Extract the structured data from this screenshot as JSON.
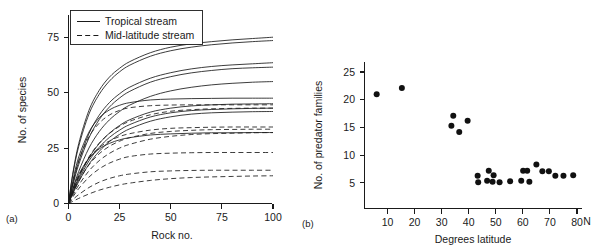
{
  "figure": {
    "background": "#ffffff",
    "ink_color": "#1a1a1a"
  },
  "panel_a": {
    "label": "(a)",
    "legend": {
      "tropical_label": "Tropical stream",
      "midlatitude_label": "Mid-latitude stream"
    }
  },
  "panel_b": {
    "label": "(b)",
    "x_suffix": "N"
  },
  "chart_data": [
    {
      "panel": "(a)",
      "type": "line",
      "title": "",
      "xlabel": "Rock no.",
      "ylabel": "No. of species",
      "xlim": [
        0,
        100
      ],
      "ylim": [
        0,
        85
      ],
      "xticks": [
        0,
        25,
        50,
        75,
        100
      ],
      "yticks": [
        0,
        25,
        50,
        75
      ],
      "xtick_labels": [
        "0",
        "25",
        "50",
        "75",
        "100"
      ],
      "ytick_labels": [
        "0",
        "25",
        "50",
        "75"
      ],
      "grid": false,
      "legend_position": "top-left",
      "legend_entries": [
        {
          "name": "Tropical stream",
          "style": "solid"
        },
        {
          "name": "Mid-latitude stream",
          "style": "dashed"
        }
      ],
      "note": "Species accumulation curves; each curve is a rarefaction-style saturating curve of form S = A*(1-exp(-k*x)) sampled at x = 0,2,5,10,15,20,25,30,40,50,60,70,80,90,100",
      "x": [
        0,
        2,
        5,
        10,
        15,
        20,
        25,
        30,
        40,
        50,
        60,
        70,
        80,
        90,
        100
      ],
      "series": [
        {
          "name": "tropical-1",
          "style": "solid",
          "asymptote": 75,
          "values": [
            0,
            13.0,
            27.0,
            42.0,
            51.0,
            57.0,
            61.0,
            64.0,
            68.0,
            70.5,
            72.0,
            73.0,
            73.8,
            74.4,
            75.0
          ]
        },
        {
          "name": "tropical-2",
          "style": "solid",
          "asymptote": 73.5,
          "values": [
            0,
            12.4,
            25.8,
            40.3,
            49.2,
            55.2,
            59.4,
            62.4,
            66.4,
            68.9,
            70.5,
            71.6,
            72.4,
            73.0,
            73.5
          ]
        },
        {
          "name": "tropical-3",
          "style": "solid",
          "asymptote": 63.5,
          "values": [
            0,
            8.5,
            19.0,
            31.5,
            39.8,
            45.5,
            49.5,
            52.5,
            56.5,
            59.0,
            60.7,
            61.8,
            62.5,
            63.0,
            63.5
          ]
        },
        {
          "name": "tropical-4",
          "style": "solid",
          "asymptote": 61.5,
          "values": [
            0,
            7.8,
            17.6,
            29.6,
            37.8,
            43.5,
            47.6,
            50.6,
            54.7,
            57.2,
            58.9,
            60.0,
            60.8,
            61.2,
            61.5
          ]
        },
        {
          "name": "tropical-5",
          "style": "solid",
          "asymptote": 55.0,
          "values": [
            0,
            6.3,
            14.5,
            25.0,
            32.4,
            37.7,
            41.5,
            44.4,
            48.3,
            50.8,
            52.4,
            53.5,
            54.2,
            54.7,
            55.0
          ]
        },
        {
          "name": "tropical-6",
          "style": "solid",
          "asymptote": 47.5,
          "values": [
            0,
            9.8,
            21.0,
            32.2,
            38.6,
            42.2,
            44.3,
            45.5,
            46.7,
            47.1,
            47.3,
            47.4,
            47.5,
            47.5,
            47.5
          ]
        },
        {
          "name": "tropical-7",
          "style": "solid",
          "asymptote": 45.0,
          "values": [
            0,
            5.0,
            11.7,
            20.6,
            27.0,
            31.7,
            35.2,
            37.8,
            41.2,
            43.0,
            44.0,
            44.5,
            44.8,
            44.9,
            45.0
          ]
        },
        {
          "name": "tropical-8",
          "style": "solid",
          "asymptote": 43.0,
          "values": [
            0,
            4.6,
            10.8,
            19.2,
            25.3,
            29.8,
            33.1,
            35.6,
            39.0,
            40.9,
            41.9,
            42.4,
            42.7,
            42.9,
            43.0
          ]
        },
        {
          "name": "tropical-9",
          "style": "solid",
          "asymptote": 41.5,
          "values": [
            0,
            4.2,
            9.9,
            17.7,
            23.5,
            27.9,
            31.2,
            33.7,
            37.1,
            39.1,
            40.3,
            40.9,
            41.2,
            41.4,
            41.5
          ]
        },
        {
          "name": "tropical-10",
          "style": "solid",
          "asymptote": 32.0,
          "values": [
            0,
            6.0,
            13.1,
            20.4,
            24.6,
            27.1,
            28.7,
            29.7,
            30.9,
            31.4,
            31.7,
            31.9,
            31.9,
            32.0,
            32.0
          ]
        },
        {
          "name": "midlat-1",
          "style": "dashed",
          "asymptote": 44.5,
          "values": [
            0,
            8.8,
            19.3,
            30.0,
            36.2,
            39.9,
            42.0,
            43.2,
            44.1,
            44.4,
            44.5,
            44.5,
            44.5,
            44.5,
            44.5
          ]
        },
        {
          "name": "midlat-2",
          "style": "dashed",
          "asymptote": 43.0,
          "values": [
            0,
            5.2,
            12.1,
            21.0,
            27.2,
            31.6,
            34.8,
            37.1,
            40.0,
            41.6,
            42.3,
            42.7,
            42.9,
            43.0,
            43.0
          ]
        },
        {
          "name": "midlat-3",
          "style": "dashed",
          "asymptote": 34.5,
          "values": [
            0,
            5.6,
            12.4,
            20.4,
            25.2,
            28.2,
            30.2,
            31.5,
            33.1,
            33.9,
            34.2,
            34.4,
            34.5,
            34.5,
            34.5
          ]
        },
        {
          "name": "midlat-4",
          "style": "dashed",
          "asymptote": 33.5,
          "values": [
            0,
            4.4,
            10.1,
            17.4,
            22.4,
            25.8,
            28.1,
            29.7,
            31.6,
            32.5,
            33.0,
            33.3,
            33.4,
            33.5,
            33.5
          ]
        },
        {
          "name": "midlat-5",
          "style": "dashed",
          "asymptote": 32.0,
          "values": [
            0,
            3.5,
            8.3,
            14.7,
            19.3,
            22.6,
            25.0,
            26.7,
            29.0,
            30.3,
            31.1,
            31.5,
            31.7,
            31.9,
            32.0
          ]
        },
        {
          "name": "midlat-6",
          "style": "dashed",
          "asymptote": 23.0,
          "values": [
            0,
            2.8,
            6.7,
            11.9,
            15.6,
            18.2,
            20.0,
            21.2,
            22.3,
            22.7,
            22.9,
            23.0,
            23.0,
            23.0,
            23.0
          ]
        },
        {
          "name": "midlat-7",
          "style": "dashed",
          "asymptote": 15.0,
          "values": [
            0,
            1.7,
            4.0,
            7.2,
            9.6,
            11.3,
            12.5,
            13.3,
            14.3,
            14.7,
            14.9,
            15.0,
            15.0,
            15.0,
            15.0
          ]
        },
        {
          "name": "midlat-8",
          "style": "dashed",
          "asymptote": 12.5,
          "values": [
            0,
            0.9,
            2.3,
            4.3,
            6.0,
            7.3,
            8.4,
            9.2,
            10.4,
            11.2,
            11.7,
            12.0,
            12.2,
            12.4,
            12.5
          ]
        }
      ]
    },
    {
      "panel": "(b)",
      "type": "scatter",
      "title": "",
      "xlabel": "Degrees latitude",
      "ylabel": "No. of predator families",
      "xlim": [
        0,
        82
      ],
      "ylim": [
        0,
        26.5
      ],
      "xticks": [
        10,
        20,
        30,
        40,
        50,
        60,
        70,
        80
      ],
      "yticks": [
        5,
        10,
        15,
        20,
        25
      ],
      "xtick_labels": [
        "10",
        "20",
        "30",
        "40",
        "50",
        "60",
        "70",
        "80"
      ],
      "ytick_labels": [
        "5",
        "10",
        "15",
        "20",
        "25"
      ],
      "grid": false,
      "marker": "filled-circle",
      "points": [
        [
          6.0,
          21.0
        ],
        [
          15.3,
          22.1
        ],
        [
          33.6,
          15.3
        ],
        [
          34.3,
          17.1
        ],
        [
          36.5,
          14.2
        ],
        [
          39.6,
          16.2
        ],
        [
          43.3,
          6.3
        ],
        [
          43.5,
          5.1
        ],
        [
          46.8,
          5.4
        ],
        [
          47.4,
          7.2
        ],
        [
          48.8,
          5.2
        ],
        [
          49.2,
          6.4
        ],
        [
          51.4,
          5.1
        ],
        [
          55.3,
          5.3
        ],
        [
          59.4,
          5.4
        ],
        [
          60.1,
          7.2
        ],
        [
          61.6,
          7.2
        ],
        [
          62.4,
          5.2
        ],
        [
          65.0,
          8.3
        ],
        [
          67.2,
          7.1
        ],
        [
          69.6,
          7.1
        ],
        [
          72.0,
          6.3
        ],
        [
          75.0,
          6.3
        ],
        [
          78.6,
          6.4
        ]
      ]
    }
  ]
}
